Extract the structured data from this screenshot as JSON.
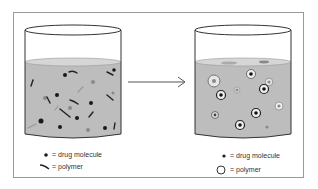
{
  "diagram": {
    "left_legend": {
      "drug_label": "= drug molecule",
      "polymer_label": "= polymer"
    },
    "right_legend": {
      "drug_label": "= drug molecule",
      "polymer_label": "= polymer"
    },
    "colors": {
      "liquid": "#bdbdbd",
      "particle_dark": "#1a1a1a",
      "particle_gray": "#8a8a8a",
      "frame": "#9a9a9a",
      "arrow": "#555555"
    }
  }
}
